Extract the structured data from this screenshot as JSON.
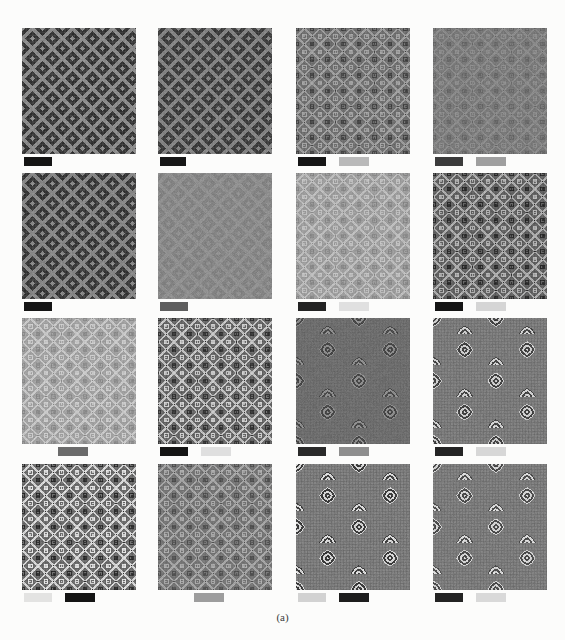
{
  "figure": {
    "caption": "(a)",
    "width": 565,
    "height": 640,
    "background_color": "#fcfcfb",
    "grid": {
      "rows": 4,
      "columns": 4
    },
    "tile_geometry": {
      "column_x": [
        22,
        158,
        296,
        433
      ],
      "row_y": [
        28,
        173,
        318,
        464
      ],
      "tile_width": 114,
      "tile_height": 126,
      "bar_offset_y": 129
    }
  },
  "tiles": [
    {
      "id": "r1c1",
      "row": 1,
      "col": 1,
      "pattern": "herringbone-twill",
      "base_color": "#6f6f6f",
      "dark_color": "#1f1f1f",
      "light_color": "#9a9a9a",
      "contrast": 0.95,
      "scale": 5,
      "bars": [
        {
          "name": "dark-scale-bar",
          "color": "#151515",
          "width": 28,
          "gap": 0,
          "faded": false
        }
      ]
    },
    {
      "id": "r1c2",
      "row": 1,
      "col": 2,
      "pattern": "herringbone-twill",
      "base_color": "#6b6b6b",
      "dark_color": "#242424",
      "light_color": "#929292",
      "contrast": 0.88,
      "scale": 5,
      "bars": [
        {
          "name": "dark-scale-bar",
          "color": "#171717",
          "width": 26,
          "gap": 0,
          "faded": false
        }
      ]
    },
    {
      "id": "r1c3",
      "row": 1,
      "col": 3,
      "pattern": "diagonal-lattice",
      "base_color": "#6e6e6e",
      "dark_color": "#2c2c2c",
      "light_color": "#b4b4b4",
      "contrast": 0.8,
      "scale": 6,
      "bars": [
        {
          "name": "dark-scale-bar",
          "color": "#161616",
          "width": 28,
          "gap": 0,
          "faded": false
        },
        {
          "name": "light-scale-bar",
          "color": "#b9b9b9",
          "width": 30,
          "gap": 13,
          "faded": false
        }
      ]
    },
    {
      "id": "r1c4",
      "row": 1,
      "col": 4,
      "pattern": "diagonal-lattice",
      "base_color": "#787878",
      "dark_color": "#4a4a4a",
      "light_color": "#a8a8a8",
      "contrast": 0.45,
      "scale": 6,
      "bars": [
        {
          "name": "dark-scale-bar",
          "color": "#3b3b3b",
          "width": 28,
          "gap": 0,
          "faded": false
        },
        {
          "name": "light-scale-bar",
          "color": "#9f9f9f",
          "width": 30,
          "gap": 13,
          "faded": false
        }
      ]
    },
    {
      "id": "r2c1",
      "row": 2,
      "col": 1,
      "pattern": "herringbone-twill",
      "base_color": "#6d6d6d",
      "dark_color": "#202020",
      "light_color": "#969696",
      "contrast": 0.92,
      "scale": 5,
      "bars": [
        {
          "name": "dark-scale-bar",
          "color": "#151515",
          "width": 28,
          "gap": 0,
          "faded": false
        }
      ]
    },
    {
      "id": "r2c2",
      "row": 2,
      "col": 2,
      "pattern": "herringbone-twill",
      "base_color": "#8a8a8a",
      "dark_color": "#6a6a6a",
      "light_color": "#a6a6a6",
      "contrast": 0.32,
      "scale": 5,
      "bars": [
        {
          "name": "dark-scale-bar",
          "color": "#5e5e5e",
          "width": 28,
          "gap": 0,
          "faded": false
        }
      ]
    },
    {
      "id": "r2c3",
      "row": 2,
      "col": 3,
      "pattern": "diagonal-lattice",
      "base_color": "#9b9b9b",
      "dark_color": "#6f6f6f",
      "light_color": "#e2e2e2",
      "contrast": 0.55,
      "scale": 6,
      "bars": [
        {
          "name": "dark-scale-bar",
          "color": "#232323",
          "width": 28,
          "gap": 0,
          "faded": false
        },
        {
          "name": "light-scale-bar",
          "color": "#e0e0e0",
          "width": 30,
          "gap": 13,
          "faded": false
        }
      ]
    },
    {
      "id": "r2c4",
      "row": 2,
      "col": 4,
      "pattern": "diagonal-lattice",
      "base_color": "#5e5e5e",
      "dark_color": "#1c1c1c",
      "light_color": "#bdbdbd",
      "contrast": 0.95,
      "scale": 6,
      "bars": [
        {
          "name": "dark-scale-bar",
          "color": "#141414",
          "width": 28,
          "gap": 0,
          "faded": false
        },
        {
          "name": "light-scale-bar",
          "color": "#d5d5d5",
          "width": 30,
          "gap": 13,
          "faded": false
        }
      ]
    },
    {
      "id": "r3c1",
      "row": 3,
      "col": 1,
      "pattern": "diagonal-lattice",
      "base_color": "#9f9f9f",
      "dark_color": "#757575",
      "light_color": "#ececec",
      "contrast": 0.6,
      "scale": 6,
      "bars": [
        {
          "name": "mid-scale-bar",
          "color": "#6b6b6b",
          "width": 30,
          "gap": 34,
          "faded": false
        }
      ]
    },
    {
      "id": "r3c2",
      "row": 3,
      "col": 2,
      "pattern": "diagonal-lattice",
      "base_color": "#636363",
      "dark_color": "#242424",
      "light_color": "#d8d8d8",
      "contrast": 0.95,
      "scale": 6,
      "bars": [
        {
          "name": "dark-scale-bar",
          "color": "#151515",
          "width": 28,
          "gap": 0,
          "faded": false
        },
        {
          "name": "light-scale-bar-faded",
          "color": "#c9c9c9",
          "width": 30,
          "gap": 13,
          "faded": true
        }
      ]
    },
    {
      "id": "r3c3",
      "row": 3,
      "col": 3,
      "pattern": "concentric-diamond",
      "base_color": "#6c6c6c",
      "dark_color": "#2a2a2a",
      "light_color": "#a4a4a4",
      "contrast": 0.7,
      "scale": 6,
      "bars": [
        {
          "name": "dark-scale-bar",
          "color": "#2a2a2a",
          "width": 28,
          "gap": 0,
          "faded": false
        },
        {
          "name": "light-scale-bar",
          "color": "#8e8e8e",
          "width": 30,
          "gap": 13,
          "faded": false
        }
      ]
    },
    {
      "id": "r3c4",
      "row": 3,
      "col": 4,
      "pattern": "concentric-diamond",
      "base_color": "#757575",
      "dark_color": "#303030",
      "light_color": "#e8e8e8",
      "contrast": 0.9,
      "scale": 6,
      "bars": [
        {
          "name": "dark-scale-bar",
          "color": "#242424",
          "width": 28,
          "gap": 0,
          "faded": false
        },
        {
          "name": "light-scale-bar",
          "color": "#d7d7d7",
          "width": 30,
          "gap": 13,
          "faded": false
        }
      ]
    },
    {
      "id": "r4c1",
      "row": 4,
      "col": 1,
      "pattern": "diagonal-lattice",
      "base_color": "#676767",
      "dark_color": "#202020",
      "light_color": "#e6e6e6",
      "contrast": 1.0,
      "scale": 6,
      "bars": [
        {
          "name": "light-scale-bar-faded",
          "color": "#cfcfcf",
          "width": 28,
          "gap": 0,
          "faded": true
        },
        {
          "name": "dark-scale-bar",
          "color": "#141414",
          "width": 30,
          "gap": 13,
          "faded": false
        }
      ]
    },
    {
      "id": "r4c2",
      "row": 4,
      "col": 2,
      "pattern": "diagonal-lattice",
      "base_color": "#737373",
      "dark_color": "#383838",
      "light_color": "#c4c4c4",
      "contrast": 0.72,
      "scale": 6,
      "bars": [
        {
          "name": "mid-scale-bar",
          "color": "#9d9d9d",
          "width": 30,
          "gap": 34,
          "faded": false
        }
      ]
    },
    {
      "id": "r4c3",
      "row": 4,
      "col": 3,
      "pattern": "concentric-diamond",
      "base_color": "#757575",
      "dark_color": "#282828",
      "light_color": "#ededed",
      "contrast": 0.95,
      "scale": 6,
      "bars": [
        {
          "name": "light-scale-bar",
          "color": "#d2d2d2",
          "width": 28,
          "gap": 0,
          "faded": false
        },
        {
          "name": "dark-scale-bar",
          "color": "#1d1d1d",
          "width": 30,
          "gap": 13,
          "faded": false
        }
      ]
    },
    {
      "id": "r4c4",
      "row": 4,
      "col": 4,
      "pattern": "concentric-diamond",
      "base_color": "#757575",
      "dark_color": "#3c3c3c",
      "light_color": "#f0f0f0",
      "contrast": 0.9,
      "scale": 6,
      "bars": [
        {
          "name": "dark-scale-bar",
          "color": "#232323",
          "width": 28,
          "gap": 0,
          "faded": false
        },
        {
          "name": "light-scale-bar",
          "color": "#d9d9d9",
          "width": 30,
          "gap": 13,
          "faded": false
        }
      ]
    }
  ]
}
